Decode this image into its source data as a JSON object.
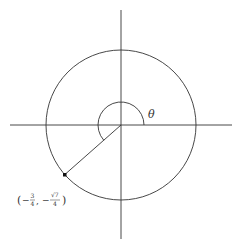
{
  "diagram": {
    "type": "unit-circle",
    "center": [
      121,
      125
    ],
    "radius": 75,
    "axes": {
      "x": {
        "from": 10,
        "to": 232
      },
      "y": {
        "from": 10,
        "to": 239
      }
    },
    "angle": {
      "label": "θ",
      "arc_radius": 23,
      "start_deg": 0,
      "end_deg": 221.4
    },
    "point": {
      "x_value": "-3/4",
      "y_value": "-√7/4",
      "label_open": "(",
      "label_minus1": "−",
      "label_num1": "3",
      "label_den1": "4",
      "label_comma": ",",
      "label_minus2": "−",
      "label_num2": "√7",
      "label_den2": "4",
      "label_close": ")"
    },
    "colors": {
      "line": "#333333",
      "point": "#111111"
    }
  }
}
